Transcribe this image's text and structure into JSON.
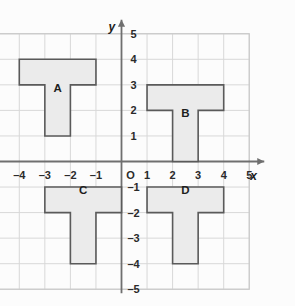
{
  "figure": {
    "kind": "coordinate-plane-shapes",
    "background_color": "#fcfcfc",
    "grid_color": "#d8d8d8",
    "grid_border_color": "#c9c9c9",
    "axis_color": "#6f6f6f",
    "shape_fill": "#ebebeb",
    "shape_stroke": "#5a5a5a",
    "origin_label": "O",
    "x_axis_name": "x",
    "y_axis_name": "y",
    "x_ticks": [
      "–5",
      "–4",
      "–3",
      "–2",
      "–1",
      "1",
      "2",
      "3",
      "4",
      "5"
    ],
    "y_ticks": [
      "5",
      "4",
      "3",
      "2",
      "1",
      "–1",
      "–2",
      "–3",
      "–4",
      "–5"
    ]
  },
  "chart_data": {
    "type": "scatter",
    "title": "",
    "xlabel": "x",
    "ylabel": "y",
    "xlim": [
      -5,
      5
    ],
    "ylim": [
      -5,
      5
    ],
    "grid": true,
    "legend": "none",
    "x_tick_values": [
      -5,
      -4,
      -3,
      -2,
      -1,
      1,
      2,
      3,
      4,
      5
    ],
    "y_tick_values": [
      5,
      4,
      3,
      2,
      1,
      -1,
      -2,
      -3,
      -4,
      -5
    ],
    "origin_label": "O",
    "annotations": [
      "A",
      "B",
      "C",
      "D"
    ],
    "shapes": [
      {
        "label": "A",
        "description": "T-shape, top bar y 3 to 4 spanning x -4 to -1, stem x -3 to -2 from y 1 to 3",
        "label_at": [
          -2.5,
          2.85
        ],
        "points": [
          [
            -4,
            4
          ],
          [
            -1,
            4
          ],
          [
            -1,
            3
          ],
          [
            -2,
            3
          ],
          [
            -2,
            1
          ],
          [
            -3,
            1
          ],
          [
            -3,
            3
          ],
          [
            -4,
            3
          ]
        ]
      },
      {
        "label": "B",
        "description": "T-shape, top bar y 2 to 3 spanning x 1 to 4, stem x 2 to 3 from y 0 to 2",
        "label_at": [
          2.5,
          1.85
        ],
        "points": [
          [
            1,
            3
          ],
          [
            4,
            3
          ],
          [
            4,
            2
          ],
          [
            3,
            2
          ],
          [
            3,
            0
          ],
          [
            2,
            0
          ],
          [
            2,
            2
          ],
          [
            1,
            2
          ]
        ]
      },
      {
        "label": "C",
        "description": "T-shape, top bar y -2 to -1 spanning x -3 to 0, stem x -2 to -1 from y -4 to -2",
        "label_at": [
          -1.5,
          -1.15
        ],
        "points": [
          [
            -3,
            -1
          ],
          [
            0,
            -1
          ],
          [
            0,
            -2
          ],
          [
            -1,
            -2
          ],
          [
            -1,
            -4
          ],
          [
            -2,
            -4
          ],
          [
            -2,
            -2
          ],
          [
            -3,
            -2
          ]
        ]
      },
      {
        "label": "D",
        "description": "T-shape, top bar y -2 to -1 spanning x 1 to 4, stem x 2 to 3 from y -4 to -2",
        "label_at": [
          2.5,
          -1.15
        ],
        "points": [
          [
            1,
            -1
          ],
          [
            4,
            -1
          ],
          [
            4,
            -2
          ],
          [
            3,
            -2
          ],
          [
            3,
            -4
          ],
          [
            2,
            -4
          ],
          [
            2,
            -2
          ],
          [
            1,
            -2
          ]
        ]
      }
    ]
  }
}
